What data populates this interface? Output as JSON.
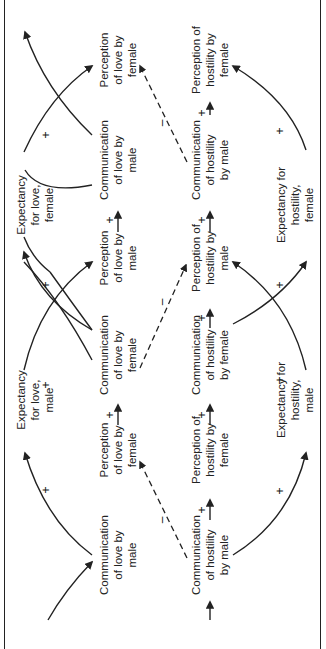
{
  "diagram": {
    "orientation": "rotated 90deg counter-clockwise",
    "expectancy_love": [
      {
        "id": "exp-love-female",
        "text": "Expectancy\nfor love,\nfemale",
        "x": 35,
        "y": 205
      },
      {
        "id": "exp-love-male",
        "text": "Expectancy\nfor love,\nmale",
        "x": 35,
        "y": 400
      }
    ],
    "love_row": [
      {
        "id": "perc-love-female-1",
        "text": "Perception\nof love by\nfemale",
        "x": 118,
        "y": 60
      },
      {
        "id": "comm-love-male-1",
        "text": "Communication\nof love by\nmale",
        "x": 118,
        "y": 160
      },
      {
        "id": "perc-love-male",
        "text": "Perception\nof love by\nmale",
        "x": 118,
        "y": 258
      },
      {
        "id": "comm-love-female",
        "text": "Communication\nof love by\nfemale",
        "x": 118,
        "y": 355
      },
      {
        "id": "perc-love-female-2",
        "text": "Perception\nof love by\nfemale",
        "x": 118,
        "y": 450
      },
      {
        "id": "comm-love-male-2",
        "text": "Communication\nof love by\nmale",
        "x": 118,
        "y": 555
      }
    ],
    "hostility_row": [
      {
        "id": "perc-host-female-1",
        "text": "Perception of\nhostility by\nfemale",
        "x": 210,
        "y": 60
      },
      {
        "id": "comm-host-male-1",
        "text": "Communication\nof hostility\nby male",
        "x": 210,
        "y": 160
      },
      {
        "id": "perc-host-male",
        "text": "Perception of\nhostility by\nmale",
        "x": 210,
        "y": 258
      },
      {
        "id": "comm-host-female",
        "text": "Communication\nof hostility\nby female",
        "x": 210,
        "y": 355
      },
      {
        "id": "perc-host-female-2",
        "text": "Perception of\nhostility by\nfemale",
        "x": 210,
        "y": 450
      },
      {
        "id": "comm-host-male-2",
        "text": "Communication\nof hostility\nby male",
        "x": 210,
        "y": 555
      }
    ],
    "expectancy_hostility": [
      {
        "id": "exp-host-female",
        "text": "Expectancy for\nhostility,\nfemale",
        "x": 295,
        "y": 205
      },
      {
        "id": "exp-host-male",
        "text": "Expectancy for\nhostility,\nmale",
        "x": 295,
        "y": 400
      }
    ],
    "signs": [
      {
        "t": "+",
        "x": 46,
        "y": 135
      },
      {
        "t": "+",
        "x": 46,
        "y": 285
      },
      {
        "t": "+",
        "x": 46,
        "y": 385
      },
      {
        "t": "+",
        "x": 46,
        "y": 490
      },
      {
        "t": "+",
        "x": 110,
        "y": 220
      },
      {
        "t": "+",
        "x": 110,
        "y": 415
      },
      {
        "t": "+",
        "x": 202,
        "y": 113
      },
      {
        "t": "+",
        "x": 202,
        "y": 220
      },
      {
        "t": "+",
        "x": 202,
        "y": 318
      },
      {
        "t": "+",
        "x": 202,
        "y": 415
      },
      {
        "t": "+",
        "x": 202,
        "y": 510
      },
      {
        "t": "+",
        "x": 280,
        "y": 131
      },
      {
        "t": "+",
        "x": 280,
        "y": 285
      },
      {
        "t": "+",
        "x": 280,
        "y": 380
      },
      {
        "t": "+",
        "x": 280,
        "y": 491
      },
      {
        "t": "–",
        "x": 162,
        "y": 123
      },
      {
        "t": "–",
        "x": 162,
        "y": 302
      },
      {
        "t": "–",
        "x": 162,
        "y": 520
      }
    ]
  }
}
